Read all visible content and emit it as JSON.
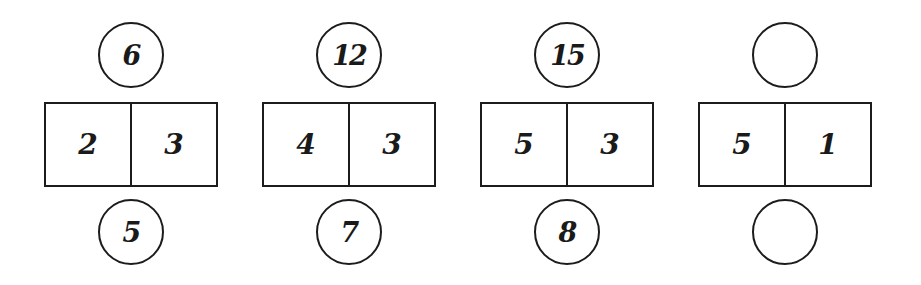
{
  "puzzle": {
    "groups": [
      {
        "top": "6",
        "left": "2",
        "right": "3",
        "bottom": "5"
      },
      {
        "top": "12",
        "left": "4",
        "right": "3",
        "bottom": "7"
      },
      {
        "top": "15",
        "left": "5",
        "right": "3",
        "bottom": "8"
      },
      {
        "top": "",
        "left": "5",
        "right": "1",
        "bottom": ""
      }
    ]
  }
}
